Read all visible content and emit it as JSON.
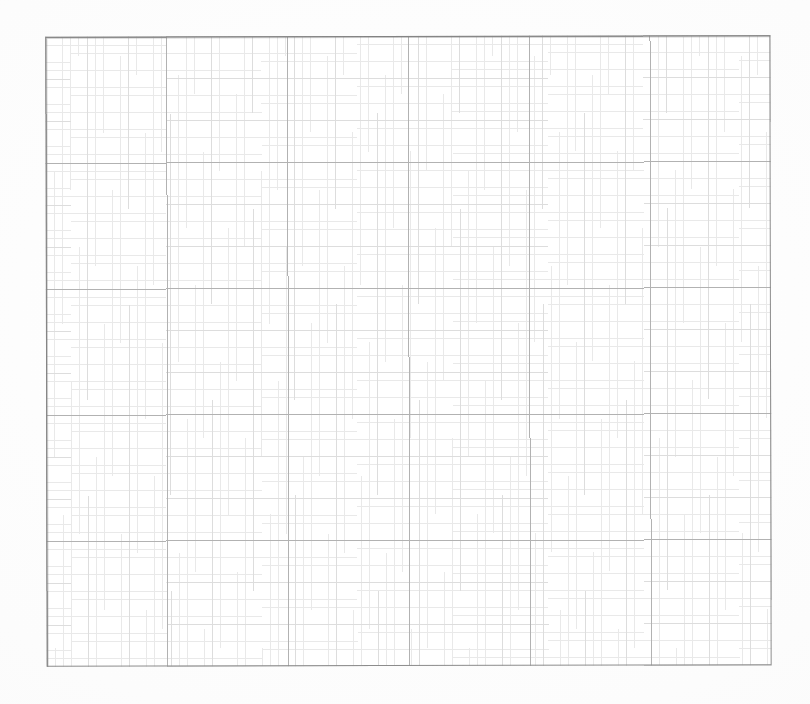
{
  "document": {
    "kind": "graph-paper-scan",
    "title": "Blank graph paper grid",
    "canvas": {
      "width": 810,
      "height": 704
    },
    "background_color": "#ffffff",
    "paper_color": "#fefefe",
    "content_text": "",
    "labels": [],
    "annotations": []
  },
  "grid": {
    "panel": {
      "left": 46,
      "top": 36,
      "width": 725,
      "height": 630,
      "border_color": "#8c8c8c",
      "border_width_px": 1.4,
      "fill_color": "#ffffff"
    },
    "minor": {
      "spacing_x_px": 8.28,
      "spacing_y_px": 8.4,
      "color": "#e9e9e9",
      "line_width_px": 0.6,
      "style": "dotted-fine"
    },
    "medium": {
      "every_n_minor": 5,
      "spacing_x_px": 41.4,
      "spacing_y_px": 42.0,
      "color": "#dddddd",
      "line_width_px": 0.8
    },
    "major": {
      "every_n_minor": 15,
      "spacing_x_px": 120.83,
      "spacing_y_px": 126.0,
      "color": "#b2b2b2",
      "line_width_px": 1.0,
      "columns": 6,
      "rows": 5,
      "vertical_positions_px": [
        46,
        167,
        287,
        408,
        529,
        650,
        771
      ],
      "horizontal_positions_px": [
        36,
        162,
        288,
        414,
        540,
        666
      ]
    },
    "skew_deg": -0.12
  },
  "chart_data": {
    "type": "table",
    "xlabel": "",
    "ylabel": "",
    "categories": [],
    "values": [],
    "series": [],
    "grid": true,
    "legend": "none"
  }
}
